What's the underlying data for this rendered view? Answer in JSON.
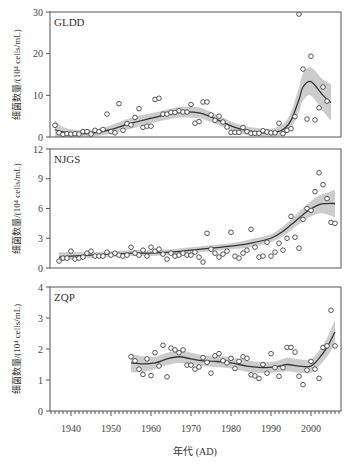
{
  "chart_data": {
    "type": "scatter",
    "title": "",
    "xlabel": "年代 (AD)",
    "x_ticks": [
      1940,
      1950,
      1960,
      1970,
      1980,
      1990,
      2000
    ],
    "xlim": [
      1935,
      2007
    ],
    "shared_x": true,
    "grid": false,
    "legend": null,
    "panels": [
      {
        "name": "GLDD",
        "ylabel": "细菌数量/(10⁴ cells/mL)",
        "ylim": [
          0,
          30
        ],
        "y_ticks": [
          0,
          10,
          20,
          30
        ],
        "points": {
          "x": [
            1936,
            1937,
            1938,
            1939,
            1940,
            1941,
            1942,
            1943,
            1944,
            1945,
            1946,
            1947,
            1948,
            1949,
            1950,
            1951,
            1952,
            1953,
            1954,
            1955,
            1956,
            1957,
            1958,
            1959,
            1960,
            1961,
            1962,
            1963,
            1964,
            1965,
            1966,
            1967,
            1968,
            1969,
            1970,
            1971,
            1972,
            1973,
            1974,
            1975,
            1976,
            1977,
            1978,
            1979,
            1980,
            1981,
            1982,
            1983,
            1984,
            1985,
            1986,
            1987,
            1988,
            1989,
            1990,
            1991,
            1992,
            1993,
            1994,
            1995,
            1996,
            1997,
            1998,
            1999,
            2000,
            2001,
            2002,
            2003,
            2004
          ],
          "y": [
            2.8,
            1.0,
            0.6,
            0.8,
            0.7,
            0.8,
            0.7,
            1.3,
            1.3,
            0.7,
            1.6,
            1.3,
            1.8,
            5.5,
            1.3,
            1.0,
            8.0,
            1.6,
            3.2,
            2.9,
            4.7,
            6.8,
            2.3,
            2.6,
            2.6,
            9.0,
            9.3,
            5.5,
            5.5,
            5.9,
            5.9,
            6.3,
            6.0,
            6.0,
            7.8,
            3.3,
            3.7,
            8.4,
            8.4,
            5.3,
            4.0,
            5.0,
            3.6,
            2.4,
            1.1,
            1.1,
            1.1,
            2.3,
            1.3,
            0.9,
            0.9,
            0.9,
            1.5,
            1.2,
            1.0,
            1.0,
            3.3,
            0.8,
            1.6,
            2.0,
            4.9,
            29.5,
            16.3,
            4.3,
            19.4,
            4.1,
            7.0,
            12.0,
            8.6
          ],
          "size": "small",
          "marker": "open-circle"
        },
        "smooth": {
          "x": [
            1936,
            1938,
            1942,
            1946,
            1950,
            1955,
            1960,
            1965,
            1968,
            1972,
            1975,
            1978,
            1982,
            1986,
            1990,
            1993,
            1995,
            1997,
            1998,
            2000,
            2003,
            2005
          ],
          "y": [
            1.8,
            1.2,
            0.8,
            1.0,
            1.8,
            3.3,
            4.5,
            5.6,
            6.0,
            5.8,
            4.8,
            3.5,
            2.0,
            1.2,
            1.0,
            1.8,
            4.0,
            9.0,
            12.0,
            13.3,
            10.0,
            8.3
          ],
          "ci_half_width": [
            2.2,
            1.2,
            0.8,
            0.8,
            1.0,
            1.3,
            1.2,
            1.2,
            1.3,
            1.3,
            1.2,
            1.1,
            1.0,
            1.0,
            1.0,
            1.3,
            2.0,
            3.0,
            3.3,
            3.4,
            3.8,
            4.4
          ]
        }
      },
      {
        "name": "NJGS",
        "ylabel": "细菌数量/(10⁴ cells/mL)",
        "ylim": [
          0,
          12
        ],
        "y_ticks": [
          0,
          3,
          6,
          9,
          12
        ],
        "points": {
          "x": [
            1937,
            1938,
            1939,
            1940,
            1941,
            1942,
            1943,
            1944,
            1945,
            1946,
            1947,
            1948,
            1949,
            1950,
            1951,
            1952,
            1953,
            1954,
            1955,
            1956,
            1957,
            1958,
            1959,
            1960,
            1961,
            1962,
            1963,
            1964,
            1965,
            1966,
            1967,
            1968,
            1969,
            1970,
            1971,
            1972,
            1973,
            1974,
            1975,
            1976,
            1977,
            1978,
            1979,
            1980,
            1981,
            1982,
            1983,
            1984,
            1985,
            1986,
            1987,
            1988,
            1989,
            1990,
            1991,
            1992,
            1993,
            1994,
            1995,
            1996,
            1997,
            1998,
            1999,
            2000,
            2001,
            2002,
            2003,
            2004,
            2005,
            2006
          ],
          "y": [
            0.7,
            1.0,
            1.0,
            1.7,
            0.9,
            1.0,
            1.1,
            1.5,
            1.7,
            1.2,
            1.2,
            1.2,
            1.6,
            1.3,
            1.5,
            1.3,
            1.2,
            1.3,
            2.1,
            1.5,
            1.3,
            1.8,
            1.2,
            2.1,
            1.7,
            1.9,
            1.4,
            0.9,
            1.5,
            1.2,
            1.3,
            1.5,
            1.3,
            1.3,
            1.6,
            1.1,
            0.6,
            3.5,
            1.9,
            1.5,
            1.1,
            1.4,
            1.7,
            3.6,
            1.2,
            1.0,
            1.5,
            1.8,
            3.9,
            2.1,
            1.1,
            1.2,
            2.6,
            1.2,
            1.6,
            2.5,
            1.8,
            3.0,
            5.2,
            3.1,
            2.0,
            4.9,
            6.0,
            5.8,
            7.7,
            9.6,
            8.4,
            7.0,
            4.6,
            4.5
          ],
          "size": "small",
          "marker": "open-circle"
        },
        "smooth": {
          "x": [
            1937,
            1940,
            1945,
            1950,
            1955,
            1960,
            1965,
            1970,
            1975,
            1980,
            1985,
            1990,
            1993,
            1996,
            1999,
            2002,
            2004,
            2006
          ],
          "y": [
            1.1,
            1.2,
            1.3,
            1.4,
            1.5,
            1.5,
            1.6,
            1.8,
            2.0,
            2.2,
            2.5,
            3.0,
            3.7,
            4.7,
            5.7,
            6.4,
            6.5,
            6.5
          ],
          "ci_half_width": [
            0.5,
            0.4,
            0.3,
            0.3,
            0.3,
            0.3,
            0.3,
            0.3,
            0.3,
            0.3,
            0.4,
            0.4,
            0.5,
            0.6,
            0.7,
            0.9,
            1.1,
            1.4
          ]
        }
      },
      {
        "name": "ZQP",
        "ylabel": "细菌数量/(10⁴ cells/mL)",
        "ylim": [
          0,
          4
        ],
        "y_ticks": [
          0,
          1,
          2,
          3,
          4
        ],
        "points": {
          "x": [
            1955,
            1956,
            1957,
            1958,
            1959,
            1960,
            1961,
            1962,
            1963,
            1964,
            1965,
            1966,
            1967,
            1968,
            1969,
            1970,
            1971,
            1972,
            1973,
            1974,
            1975,
            1976,
            1977,
            1978,
            1979,
            1980,
            1981,
            1982,
            1983,
            1984,
            1985,
            1986,
            1987,
            1988,
            1989,
            1990,
            1991,
            1992,
            1993,
            1994,
            1995,
            1996,
            1997,
            1998,
            1999,
            2000,
            2001,
            2002,
            2003,
            2004,
            2005,
            2006
          ],
          "y": [
            1.75,
            1.62,
            1.35,
            1.18,
            1.68,
            1.14,
            1.88,
            1.45,
            2.12,
            1.1,
            2.03,
            1.97,
            1.88,
            1.97,
            1.48,
            1.48,
            1.35,
            1.42,
            1.72,
            1.57,
            1.22,
            1.78,
            1.85,
            1.62,
            1.55,
            1.7,
            1.37,
            1.6,
            1.75,
            1.7,
            1.17,
            1.13,
            1.05,
            1.5,
            1.22,
            1.85,
            1.4,
            1.12,
            1.4,
            2.05,
            2.05,
            1.9,
            1.12,
            0.85,
            1.32,
            1.6,
            1.35,
            1.05,
            2.05,
            2.1,
            3.25,
            2.1
          ],
          "size": "small",
          "marker": "open-circle"
        },
        "smooth": {
          "x": [
            1955,
            1958,
            1961,
            1964,
            1967,
            1970,
            1973,
            1976,
            1980,
            1984,
            1988,
            1991,
            1994,
            1997,
            2000,
            2002,
            2004,
            2006
          ],
          "y": [
            1.55,
            1.52,
            1.55,
            1.68,
            1.75,
            1.68,
            1.62,
            1.6,
            1.55,
            1.45,
            1.4,
            1.42,
            1.5,
            1.45,
            1.45,
            1.7,
            2.05,
            2.55
          ],
          "ci_half_width": [
            0.3,
            0.25,
            0.2,
            0.2,
            0.2,
            0.2,
            0.18,
            0.18,
            0.18,
            0.18,
            0.18,
            0.18,
            0.22,
            0.22,
            0.22,
            0.25,
            0.3,
            0.4
          ]
        }
      }
    ]
  },
  "colors": {
    "axis": "#555555",
    "points": "#444444",
    "smooth_line": "#333333",
    "ci_band": "#cccccc"
  }
}
